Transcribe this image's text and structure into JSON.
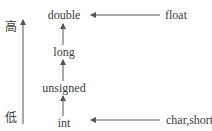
{
  "diagram": {
    "axis": {
      "high_label": "高",
      "low_label": "低"
    },
    "chain": [
      {
        "id": "double",
        "label": "double"
      },
      {
        "id": "long",
        "label": "long"
      },
      {
        "id": "unsigned",
        "label": "unsigned"
      },
      {
        "id": "int",
        "label": "int"
      }
    ],
    "side_inputs": [
      {
        "id": "float",
        "label": "float",
        "target": "double"
      },
      {
        "id": "char-short",
        "label": "char,short",
        "target": "int"
      }
    ],
    "colors": {
      "line": "#555555",
      "text": "#3a3a3a",
      "background": "#ffffff"
    }
  }
}
